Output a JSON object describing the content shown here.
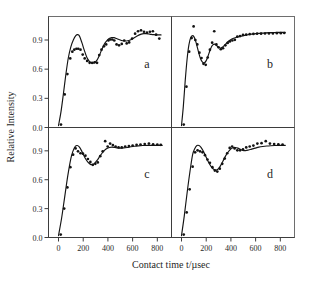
{
  "figure": {
    "axis_titles": {
      "x": "Contact time t/µsec",
      "y": "Relative Intensity"
    },
    "colors": {
      "curve": "#141414",
      "points": "#121212",
      "axis": "#3d3d3d",
      "frame": "#6e6e6e",
      "background": "#ffffff"
    }
  },
  "chart_data": {
    "type": "line",
    "title": "",
    "subtitle": "",
    "xlabel": "Contact time t/µsec",
    "ylabel": "Relative Intensity",
    "xlim": [
      0,
      850
    ],
    "ylim": [
      0.0,
      1.08
    ],
    "xticks": [
      0,
      200,
      400,
      600,
      800
    ],
    "xticklabels": [
      "0",
      "200",
      "400",
      "600",
      "800"
    ],
    "yticks": [
      0.0,
      0.3,
      0.6,
      0.9
    ],
    "yticklabels": [
      "0.0",
      "0.3",
      "0.6",
      "0.9"
    ],
    "grid": false,
    "legend": null,
    "layout": "2x2 panel grid, shared axes",
    "panels": [
      {
        "id": "a",
        "label": "a",
        "position": "top-left",
        "series": [
          {
            "name": "fit-curve",
            "type": "line",
            "x": [
              0,
              20,
              40,
              60,
              80,
              100,
              120,
              140,
              155,
              170,
              190,
              210,
              230,
              250,
              270,
              290,
              310,
              330,
              350,
              370,
              390,
              410,
              430,
              450,
              470,
              490,
              510,
              530,
              550,
              570,
              590,
              610,
              630,
              650,
              670,
              690,
              710,
              730,
              750,
              770,
              790,
              810,
              830
            ],
            "y": [
              0.02,
              0.16,
              0.35,
              0.55,
              0.72,
              0.83,
              0.9,
              0.945,
              0.955,
              0.94,
              0.87,
              0.79,
              0.72,
              0.68,
              0.665,
              0.665,
              0.69,
              0.74,
              0.8,
              0.855,
              0.89,
              0.915,
              0.925,
              0.925,
              0.915,
              0.905,
              0.895,
              0.89,
              0.89,
              0.895,
              0.905,
              0.92,
              0.935,
              0.95,
              0.96,
              0.965,
              0.965,
              0.962,
              0.958,
              0.955,
              0.953,
              0.952,
              0.952
            ]
          },
          {
            "name": "data-points",
            "type": "scatter",
            "x": [
              20,
              50,
              72,
              95,
              112,
              128,
              145,
              160,
              178,
              196,
              212,
              232,
              252,
              272,
              292,
              312,
              330,
              348,
              368,
              386,
              404,
              420,
              436,
              452,
              470,
              490,
              512,
              532,
              552,
              572,
              596,
              620,
              644,
              668,
              692,
              716,
              740,
              764,
              790,
              816
            ],
            "y": [
              0.03,
              0.34,
              0.55,
              0.71,
              0.78,
              0.8,
              0.81,
              0.81,
              0.8,
              0.75,
              0.71,
              0.685,
              0.665,
              0.665,
              0.67,
              0.665,
              0.745,
              0.8,
              0.835,
              0.855,
              0.895,
              0.905,
              0.905,
              0.895,
              0.855,
              0.845,
              0.86,
              0.895,
              0.865,
              0.875,
              0.915,
              0.965,
              0.99,
              1.0,
              0.985,
              0.975,
              0.985,
              0.99,
              0.955,
              0.915
            ]
          }
        ]
      },
      {
        "id": "b",
        "label": "b",
        "position": "top-right",
        "series": [
          {
            "name": "fit-curve",
            "type": "line",
            "x": [
              0,
              15,
              30,
              45,
              60,
              75,
              90,
              100,
              112,
              125,
              140,
              155,
              170,
              185,
              200,
              215,
              230,
              245,
              258,
              272,
              288,
              302,
              318,
              334,
              350,
              368,
              386,
              404,
              422,
              440,
              460,
              480,
              500,
              525,
              550,
              580,
              610,
              645,
              680,
              715,
              750,
              785,
              820,
              840
            ],
            "y": [
              0.02,
              0.22,
              0.48,
              0.7,
              0.85,
              0.925,
              0.945,
              0.935,
              0.9,
              0.84,
              0.765,
              0.705,
              0.672,
              0.665,
              0.688,
              0.735,
              0.79,
              0.835,
              0.855,
              0.855,
              0.838,
              0.822,
              0.818,
              0.828,
              0.848,
              0.872,
              0.893,
              0.908,
              0.918,
              0.925,
              0.932,
              0.938,
              0.944,
              0.951,
              0.957,
              0.963,
              0.967,
              0.971,
              0.974,
              0.976,
              0.977,
              0.978,
              0.979,
              0.979
            ]
          },
          {
            "name": "data-points",
            "type": "scatter",
            "x": [
              18,
              40,
              62,
              82,
              98,
              112,
              128,
              145,
              162,
              178,
              196,
              212,
              230,
              248,
              265,
              282,
              300,
              318,
              336,
              355,
              374,
              392,
              412,
              432,
              452,
              474,
              498,
              524,
              552,
              582,
              612,
              644,
              676,
              708,
              740,
              772,
              804,
              832
            ],
            "y": [
              0.03,
              0.42,
              0.78,
              0.92,
              1.04,
              0.9,
              0.855,
              0.77,
              0.715,
              0.655,
              0.645,
              0.72,
              0.8,
              0.872,
              0.99,
              0.855,
              0.825,
              0.805,
              0.815,
              0.845,
              0.87,
              0.885,
              0.895,
              0.902,
              0.935,
              0.94,
              0.952,
              0.955,
              0.96,
              0.962,
              0.965,
              0.965,
              0.967,
              0.968,
              0.968,
              0.97,
              0.97,
              0.972
            ]
          }
        ]
      },
      {
        "id": "c",
        "label": "c",
        "position": "bottom-left",
        "series": [
          {
            "name": "fit-curve",
            "type": "line",
            "x": [
              0,
              25,
              50,
              75,
              100,
              118,
              135,
              152,
              168,
              185,
              202,
              220,
              238,
              256,
              274,
              292,
              312,
              332,
              352,
              372,
              392,
              412,
              432,
              455,
              478,
              502,
              528,
              556,
              585,
              615,
              648,
              682,
              716,
              750,
              785,
              820,
              840
            ],
            "y": [
              0.02,
              0.2,
              0.42,
              0.64,
              0.82,
              0.9,
              0.945,
              0.955,
              0.94,
              0.905,
              0.86,
              0.815,
              0.782,
              0.762,
              0.758,
              0.77,
              0.8,
              0.838,
              0.875,
              0.905,
              0.925,
              0.935,
              0.938,
              0.935,
              0.93,
              0.928,
              0.93,
              0.935,
              0.942,
              0.948,
              0.952,
              0.955,
              0.956,
              0.957,
              0.957,
              0.957,
              0.957
            ]
          },
          {
            "name": "data-points",
            "type": "scatter",
            "x": [
              18,
              46,
              72,
              96,
              118,
              138,
              158,
              178,
              198,
              218,
              238,
              258,
              278,
              298,
              318,
              338,
              358,
              378,
              398,
              418,
              440,
              462,
              486,
              512,
              540,
              570,
              600,
              632,
              664,
              698,
              732,
              766,
              800,
              828
            ],
            "y": [
              0.03,
              0.3,
              0.52,
              0.73,
              0.86,
              0.925,
              0.895,
              0.875,
              0.87,
              0.85,
              0.815,
              0.785,
              0.755,
              0.765,
              0.78,
              0.845,
              0.895,
              1.0,
              0.945,
              0.975,
              0.96,
              0.945,
              0.935,
              0.935,
              0.945,
              0.95,
              0.955,
              0.962,
              0.965,
              0.97,
              0.975,
              0.968,
              0.965,
              0.962
            ]
          }
        ]
      },
      {
        "id": "d",
        "label": "d",
        "position": "bottom-right",
        "series": [
          {
            "name": "fit-curve",
            "type": "line",
            "x": [
              0,
              22,
              45,
              68,
              90,
              108,
              125,
              142,
              158,
              175,
              192,
              210,
              228,
              246,
              264,
              282,
              300,
              318,
              336,
              356,
              376,
              396,
              416,
              436,
              456,
              476,
              496,
              518,
              542,
              568,
              596,
              626,
              658,
              690,
              722,
              756,
              790,
              820,
              840
            ],
            "y": [
              0.02,
              0.22,
              0.46,
              0.68,
              0.86,
              0.925,
              0.955,
              0.955,
              0.935,
              0.9,
              0.855,
              0.805,
              0.76,
              0.725,
              0.705,
              0.7,
              0.715,
              0.75,
              0.795,
              0.845,
              0.885,
              0.915,
              0.932,
              0.935,
              0.928,
              0.915,
              0.905,
              0.902,
              0.908,
              0.918,
              0.928,
              0.938,
              0.945,
              0.95,
              0.953,
              0.955,
              0.956,
              0.956,
              0.956
            ]
          },
          {
            "name": "data-points",
            "type": "scatter",
            "x": [
              18,
              42,
              66,
              90,
              110,
              130,
              150,
              170,
              190,
              210,
              230,
              250,
              270,
              290,
              310,
              330,
              350,
              370,
              390,
              410,
              430,
              452,
              474,
              498,
              524,
              552,
              582,
              614,
              648,
              682,
              716,
              750,
              784,
              818
            ],
            "y": [
              0.03,
              0.26,
              0.5,
              0.735,
              0.885,
              0.905,
              0.895,
              0.885,
              0.855,
              0.81,
              0.775,
              0.73,
              0.695,
              0.685,
              0.715,
              0.765,
              0.82,
              0.875,
              0.93,
              0.945,
              0.925,
              0.905,
              0.905,
              0.915,
              0.935,
              0.945,
              0.955,
              0.975,
              0.98,
              1.0,
              0.975,
              0.97,
              0.968,
              0.965
            ]
          }
        ]
      }
    ]
  }
}
